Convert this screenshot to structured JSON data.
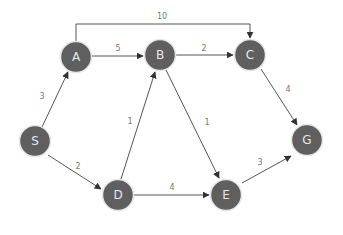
{
  "diagram": {
    "type": "weighted directed graph",
    "nodes": [
      {
        "id": "S",
        "label": "S",
        "x": 35,
        "y": 141
      },
      {
        "id": "A",
        "label": "A",
        "x": 76,
        "y": 57
      },
      {
        "id": "B",
        "label": "B",
        "x": 160,
        "y": 55
      },
      {
        "id": "C",
        "label": "C",
        "x": 250,
        "y": 55
      },
      {
        "id": "D",
        "label": "D",
        "x": 118,
        "y": 195
      },
      {
        "id": "E",
        "label": "E",
        "x": 226,
        "y": 195
      },
      {
        "id": "G",
        "label": "G",
        "x": 307,
        "y": 140
      }
    ],
    "edges": [
      {
        "from": "S",
        "to": "A",
        "weight": "3"
      },
      {
        "from": "S",
        "to": "D",
        "weight": "2"
      },
      {
        "from": "A",
        "to": "B",
        "weight": "5"
      },
      {
        "from": "A",
        "to": "C",
        "weight": "10"
      },
      {
        "from": "B",
        "to": "C",
        "weight": "2"
      },
      {
        "from": "B",
        "to": "E",
        "weight": "1"
      },
      {
        "from": "D",
        "to": "B",
        "weight": "1"
      },
      {
        "from": "D",
        "to": "E",
        "weight": "4"
      },
      {
        "from": "C",
        "to": "G",
        "weight": "4"
      },
      {
        "from": "E",
        "to": "G",
        "weight": "3"
      }
    ]
  },
  "colors": {
    "node_fill": "#5f5f5f",
    "node_text": "#e8e8e8",
    "edge": "#555555",
    "label": "#777777"
  }
}
